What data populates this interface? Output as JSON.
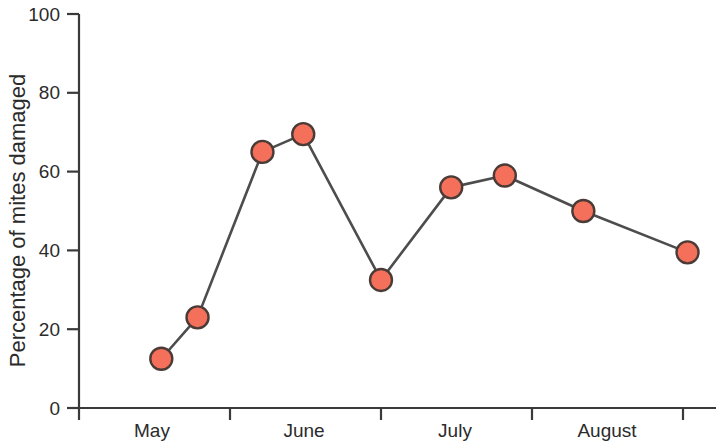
{
  "chart_data": {
    "type": "line",
    "title": "",
    "subtitle": "",
    "xlabel": "",
    "ylabel": "Percentage of mites damaged",
    "ylim": [
      0,
      100
    ],
    "xlim": [
      0,
      4
    ],
    "grid": false,
    "legend": null,
    "yticks": [
      0,
      20,
      40,
      60,
      80,
      100
    ],
    "ytick_labels": [
      "0",
      "20",
      "40",
      "60",
      "80",
      "100"
    ],
    "xtick_positions": [
      0,
      1,
      2,
      3,
      4
    ],
    "xtick_labels": [
      "",
      "",
      "",
      "",
      ""
    ],
    "x_category_labels": [
      "May",
      "June",
      "July",
      "August"
    ],
    "series": [
      {
        "name": "Percentage of mites damaged",
        "marker": "circle",
        "marker_color": "#F4705A",
        "marker_edge_color": "#4a3b36",
        "line_color": "#4d4d4d",
        "x": [
          0.545,
          0.785,
          1.215,
          1.485,
          2.0,
          2.465,
          2.82,
          3.34,
          4.03
        ],
        "values": [
          12.5,
          23.0,
          65.0,
          69.5,
          32.5,
          56.0,
          59.0,
          50.0,
          39.5
        ]
      }
    ],
    "points": [
      {
        "x": 0.545,
        "y": 12.5
      },
      {
        "x": 0.785,
        "y": 23.0
      },
      {
        "x": 1.215,
        "y": 65.0
      },
      {
        "x": 1.485,
        "y": 69.5
      },
      {
        "x": 2.0,
        "y": 32.5
      },
      {
        "x": 2.465,
        "y": 56.0
      },
      {
        "x": 2.82,
        "y": 59.0
      },
      {
        "x": 3.34,
        "y": 50.0
      },
      {
        "x": 4.03,
        "y": 39.5
      }
    ]
  },
  "axes": {
    "y_title": "Percentage of mites damaged",
    "y_ticks": [
      {
        "label": "100",
        "value": 100
      },
      {
        "label": "80",
        "value": 80
      },
      {
        "label": "60",
        "value": 60
      },
      {
        "label": "40",
        "value": 40
      },
      {
        "label": "20",
        "value": 20
      },
      {
        "label": "0",
        "value": 0
      }
    ],
    "x_labels": [
      {
        "label": "May"
      },
      {
        "label": "June"
      },
      {
        "label": "July"
      },
      {
        "label": "August"
      }
    ]
  },
  "colors": {
    "marker_fill": "#F4705A",
    "marker_edge": "#4a3b36",
    "line": "#4d4d4d",
    "axis": "#3a3a3a",
    "text": "#2b2b2b",
    "background": "#ffffff"
  }
}
